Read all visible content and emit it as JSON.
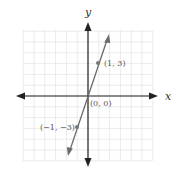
{
  "chart_data": {
    "type": "line",
    "title": "",
    "xlabel": "x",
    "ylabel": "y",
    "equation": "y = 3x",
    "xlim": [
      -6,
      6
    ],
    "ylim": [
      -6,
      6
    ],
    "grid": true,
    "series": [
      {
        "name": "y = 3x",
        "color": "#6b6b6b",
        "points": [
          {
            "x": -1,
            "y": -3,
            "label": "(−1, −3)"
          },
          {
            "x": 0,
            "y": 0,
            "label": "(0, 0)"
          },
          {
            "x": 1,
            "y": 3,
            "label": "(1, 3)"
          }
        ]
      }
    ]
  },
  "labels": {
    "x_axis": "x",
    "y_axis": "y",
    "point_upper": "(1, 3)",
    "point_origin": "(0, 0)",
    "point_lower": "(−1, −3)"
  },
  "colors": {
    "grid": "#e6e6e6",
    "axis": "#222222",
    "line": "#6b6b6b",
    "point": "#777777"
  }
}
